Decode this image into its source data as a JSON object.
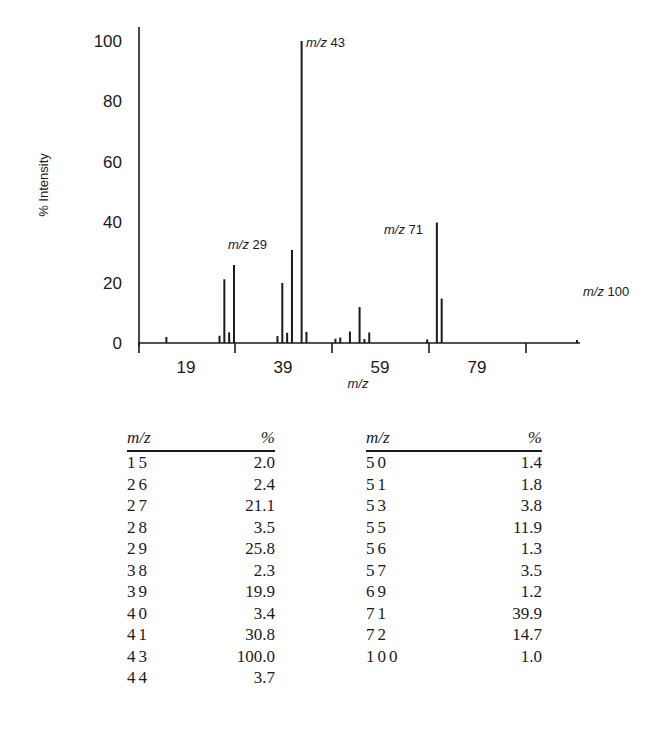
{
  "chart_data": {
    "type": "bar",
    "title": "",
    "xlabel": "m/z",
    "ylabel": "% Intensity",
    "ylim": [
      0,
      100
    ],
    "xlim": [
      9,
      101
    ],
    "yticks": [
      0,
      20,
      40,
      60,
      80,
      100
    ],
    "xticks_labels": [
      "19",
      "39",
      "59",
      "79"
    ],
    "grid": false,
    "annotations": [
      {
        "text_italic": "m/z",
        "text": "43",
        "x": 43,
        "y": 100
      },
      {
        "text_italic": "m/z",
        "text": "29",
        "x": 29,
        "y": 25.8
      },
      {
        "text_italic": "m/z",
        "text": "71",
        "x": 71,
        "y": 39.9
      },
      {
        "text_italic": "m/z",
        "text": "100",
        "x": 100,
        "y": 1.0
      }
    ],
    "x": [
      15,
      26,
      27,
      28,
      29,
      38,
      39,
      40,
      41,
      43,
      44,
      50,
      51,
      53,
      55,
      56,
      57,
      69,
      71,
      72,
      100
    ],
    "values": [
      2.0,
      2.4,
      21.1,
      3.5,
      25.8,
      2.3,
      19.9,
      3.4,
      30.8,
      100.0,
      3.7,
      1.4,
      1.8,
      3.8,
      11.9,
      1.3,
      3.5,
      1.2,
      39.9,
      14.7,
      1.0
    ]
  },
  "table": {
    "columns": [
      {
        "mz_header": "m/z",
        "pct_header": "%",
        "rows": [
          {
            "mz": "15",
            "pct": "2.0"
          },
          {
            "mz": "26",
            "pct": "2.4"
          },
          {
            "mz": "27",
            "pct": "21.1"
          },
          {
            "mz": "28",
            "pct": "3.5"
          },
          {
            "mz": "29",
            "pct": "25.8"
          },
          {
            "mz": "38",
            "pct": "2.3"
          },
          {
            "mz": "39",
            "pct": "19.9"
          },
          {
            "mz": "40",
            "pct": "3.4"
          },
          {
            "mz": "41",
            "pct": "30.8"
          },
          {
            "mz": "43",
            "pct": "100.0"
          },
          {
            "mz": "44",
            "pct": "3.7"
          }
        ]
      },
      {
        "mz_header": "m/z",
        "pct_header": "%",
        "rows": [
          {
            "mz": "50",
            "pct": "1.4"
          },
          {
            "mz": "51",
            "pct": "1.8"
          },
          {
            "mz": "53",
            "pct": "3.8"
          },
          {
            "mz": "55",
            "pct": "11.9"
          },
          {
            "mz": "56",
            "pct": "1.3"
          },
          {
            "mz": "57",
            "pct": "3.5"
          },
          {
            "mz": "69",
            "pct": "1.2"
          },
          {
            "mz": "71",
            "pct": "39.9"
          },
          {
            "mz": "72",
            "pct": "14.7"
          },
          {
            "mz": "100",
            "pct": "1.0"
          }
        ]
      }
    ]
  }
}
